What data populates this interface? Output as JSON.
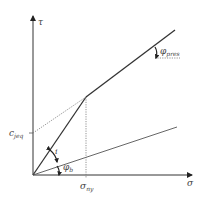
{
  "diagram": {
    "axes": {
      "x_label": "σ",
      "y_label": "τ"
    },
    "labels": {
      "cohesion": {
        "main": "c",
        "sub": "jeq"
      },
      "sigma_ny": {
        "main": "σ",
        "sub": "ny"
      },
      "phi_res": {
        "main": "φ",
        "sub": "pres"
      },
      "phi_b": {
        "main": "φ",
        "sub": "b"
      },
      "i": "i"
    },
    "colors": {
      "line": "#333333",
      "thin_line": "#555555",
      "dotted": "#777777",
      "text": "#444444"
    }
  }
}
